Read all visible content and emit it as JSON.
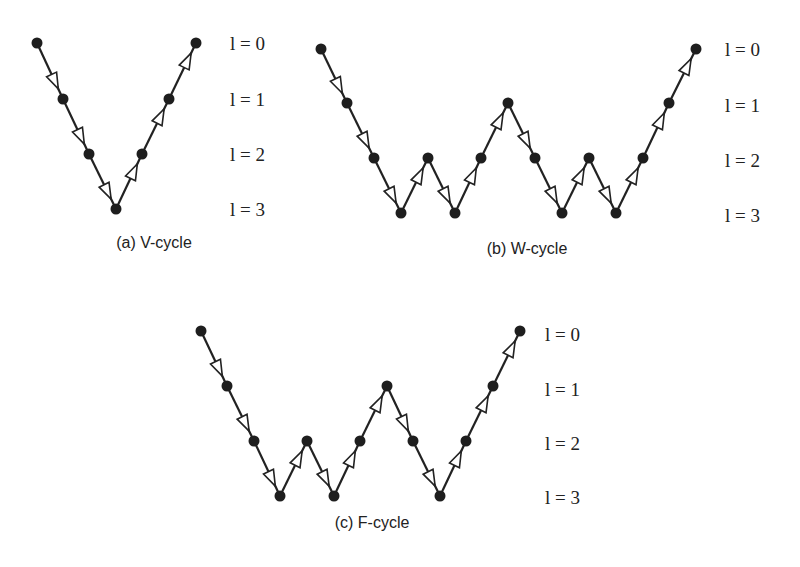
{
  "figure": {
    "panels": [
      {
        "id": "v-cycle",
        "caption": "(a) V-cycle",
        "caption_pos": [
          154,
          248
        ],
        "nodes": [
          [
            37,
            43
          ],
          [
            63,
            99
          ],
          [
            89,
            154
          ],
          [
            116,
            209
          ],
          [
            142,
            154
          ],
          [
            169,
            99
          ],
          [
            196,
            43
          ]
        ],
        "levels": [
          0,
          1,
          2,
          3,
          2,
          1,
          0
        ],
        "level_labels": [
          {
            "text": "l = 0",
            "x": 230,
            "y": 50
          },
          {
            "text": "l = 1",
            "x": 230,
            "y": 106
          },
          {
            "text": "l = 2",
            "x": 230,
            "y": 161
          },
          {
            "text": "l = 3",
            "x": 230,
            "y": 216
          }
        ]
      },
      {
        "id": "w-cycle",
        "caption": "(b) W-cycle",
        "caption_pos": [
          527,
          254
        ],
        "nodes": [
          [
            321,
            49
          ],
          [
            347,
            103
          ],
          [
            374,
            158
          ],
          [
            401,
            213
          ],
          [
            428,
            158
          ],
          [
            455,
            213
          ],
          [
            481,
            158
          ],
          [
            508,
            103
          ],
          [
            535,
            158
          ],
          [
            562,
            213
          ],
          [
            589,
            158
          ],
          [
            616,
            213
          ],
          [
            643,
            158
          ],
          [
            669,
            103
          ],
          [
            696,
            49
          ]
        ],
        "levels": [
          0,
          1,
          2,
          3,
          2,
          3,
          2,
          1,
          2,
          3,
          2,
          3,
          2,
          1,
          0
        ],
        "level_labels": [
          {
            "text": "l = 0",
            "x": 725,
            "y": 56
          },
          {
            "text": "l = 1",
            "x": 725,
            "y": 112
          },
          {
            "text": "l = 2",
            "x": 725,
            "y": 167
          },
          {
            "text": "l = 3",
            "x": 725,
            "y": 222
          }
        ]
      },
      {
        "id": "f-cycle",
        "caption": "(c) F-cycle",
        "caption_pos": [
          372,
          528
        ],
        "nodes": [
          [
            201,
            331
          ],
          [
            227,
            386
          ],
          [
            254,
            441
          ],
          [
            280,
            496
          ],
          [
            307,
            441
          ],
          [
            334,
            496
          ],
          [
            360,
            441
          ],
          [
            387,
            386
          ],
          [
            413,
            441
          ],
          [
            440,
            496
          ],
          [
            466,
            441
          ],
          [
            493,
            386
          ],
          [
            520,
            331
          ]
        ],
        "levels": [
          0,
          1,
          2,
          3,
          2,
          3,
          2,
          1,
          2,
          3,
          2,
          1,
          0
        ],
        "level_labels": [
          {
            "text": "l = 0",
            "x": 545,
            "y": 341
          },
          {
            "text": "l = 1",
            "x": 545,
            "y": 396
          },
          {
            "text": "l = 2",
            "x": 545,
            "y": 450
          },
          {
            "text": "l = 3",
            "x": 545,
            "y": 504
          }
        ]
      }
    ]
  },
  "colors": {
    "ink": "#1e1e1e",
    "background": "#ffffff"
  }
}
